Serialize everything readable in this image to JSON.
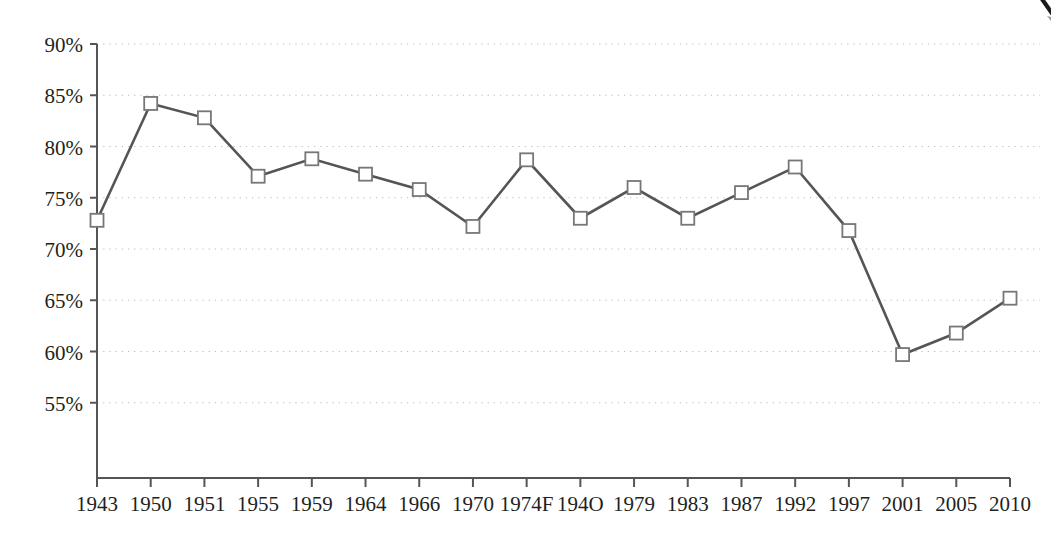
{
  "chart_data": {
    "type": "line",
    "title": "",
    "subtitle": "",
    "xlabel": "",
    "ylabel": "",
    "categories": [
      "1943",
      "1950",
      "1951",
      "1955",
      "1959",
      "1964",
      "1966",
      "1970",
      "1974F",
      "194O",
      "1979",
      "1983",
      "1987",
      "1992",
      "1997",
      "2001",
      "2005",
      "2010"
    ],
    "values": [
      72.8,
      84.2,
      82.8,
      77.1,
      78.8,
      77.3,
      75.8,
      72.2,
      78.7,
      73.0,
      76.0,
      73.0,
      75.5,
      78.0,
      71.8,
      59.7,
      61.8,
      65.2
    ],
    "ytick_labels": [
      "90%",
      "85%",
      "80%",
      "75%",
      "70%",
      "65%",
      "60%",
      "55%"
    ],
    "ytick_values": [
      90,
      85,
      80,
      75,
      70,
      65,
      60,
      55
    ],
    "ylim": [
      52.5,
      90
    ],
    "grid": "horizontal-dotted",
    "legend": "none",
    "marker": "open-square",
    "series_name": "",
    "colors": {
      "line": "#555555",
      "marker_fill": "#ffffff",
      "marker_stroke": "#777777",
      "axis": "#555555",
      "grid": "#bbbbbb",
      "text": "#231f20",
      "background": "#ffffff"
    }
  }
}
